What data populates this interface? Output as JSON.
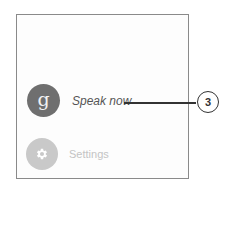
{
  "screen": {
    "items": [
      {
        "label": "Speak now",
        "icon": "google-g-icon",
        "icon_glyph": "g",
        "state": "active"
      },
      {
        "label": "Settings",
        "icon": "gear-icon",
        "state": "dimmed"
      }
    ]
  },
  "callout": {
    "number": "3"
  },
  "colors": {
    "google_circle": "#6f6f6f",
    "settings_circle": "#c9c9c9",
    "frame_border": "#8a8a8a",
    "callout": "#333333"
  }
}
